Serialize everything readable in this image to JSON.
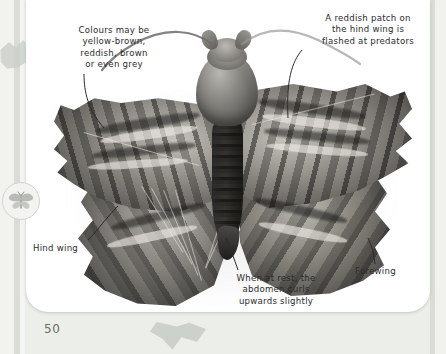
{
  "page": {
    "number": "50",
    "background_color": "#eceee9",
    "card_color": "#ffffff",
    "tab_color": "#56585a"
  },
  "subject": {
    "name": "moth-photograph",
    "description": "Greyscale photograph of a hawk-moth with wings spread"
  },
  "margin_icon": {
    "name": "moth-badge-icon",
    "label": "moth"
  },
  "annotations": [
    {
      "id": "colour-note",
      "text": "Colours may be\nyellow-brown,\nreddish, brown\nor even grey"
    },
    {
      "id": "reddish-patch-note",
      "text": "A reddish patch on\nthe hind wing is\nflashed at predators"
    },
    {
      "id": "hind-wing-label",
      "text": "Hind wing"
    },
    {
      "id": "forewing-label",
      "text": "Forewing"
    },
    {
      "id": "abdomen-note",
      "text": "When at rest, the\nabdomen curls\nupwards slightly"
    }
  ]
}
